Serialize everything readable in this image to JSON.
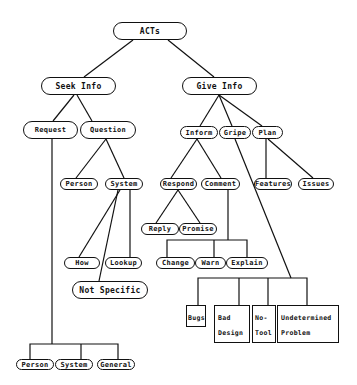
{
  "diagram": {
    "title": "ACTs",
    "nodes": {
      "acts": "ACTs",
      "seek_info": "Seek Info",
      "give_info": "Give Info",
      "request": "Request",
      "question": "Question",
      "inform": "Inform",
      "gripe": "Gripe",
      "plan": "Plan",
      "q_person": "Person",
      "q_system": "System",
      "respond": "Respond",
      "comment": "Comment",
      "features": "Features",
      "issues": "Issues",
      "reply": "Reply",
      "promise": "Promise",
      "how": "How",
      "lookup": "Lookup",
      "change": "Change",
      "warn": "Warn",
      "explain": "Explain",
      "not_specific": "Not Specific",
      "bugs": "Bugs",
      "bad_design": "Bad Design",
      "no_tool": "No-Tool",
      "undetermined_problem": "Undetermined Problem",
      "r_person": "Person",
      "r_system": "System",
      "r_general": "General"
    },
    "edges": [
      [
        "acts",
        "seek_info"
      ],
      [
        "acts",
        "give_info"
      ],
      [
        "seek_info",
        "request"
      ],
      [
        "seek_info",
        "question"
      ],
      [
        "give_info",
        "inform"
      ],
      [
        "give_info",
        "gripe"
      ],
      [
        "give_info",
        "plan"
      ],
      [
        "question",
        "q_person"
      ],
      [
        "question",
        "q_system"
      ],
      [
        "q_system",
        "how"
      ],
      [
        "q_system",
        "lookup"
      ],
      [
        "q_system",
        "not_specific"
      ],
      [
        "inform",
        "respond"
      ],
      [
        "inform",
        "comment"
      ],
      [
        "respond",
        "reply"
      ],
      [
        "respond",
        "promise"
      ],
      [
        "comment",
        "change"
      ],
      [
        "comment",
        "warn"
      ],
      [
        "comment",
        "explain"
      ],
      [
        "plan",
        "features"
      ],
      [
        "plan",
        "issues"
      ],
      [
        "gripe",
        "bugs"
      ],
      [
        "gripe",
        "bad_design"
      ],
      [
        "gripe",
        "no_tool"
      ],
      [
        "gripe",
        "undetermined_problem"
      ],
      [
        "request",
        "r_person"
      ],
      [
        "request",
        "r_system"
      ],
      [
        "request",
        "r_general"
      ]
    ]
  }
}
